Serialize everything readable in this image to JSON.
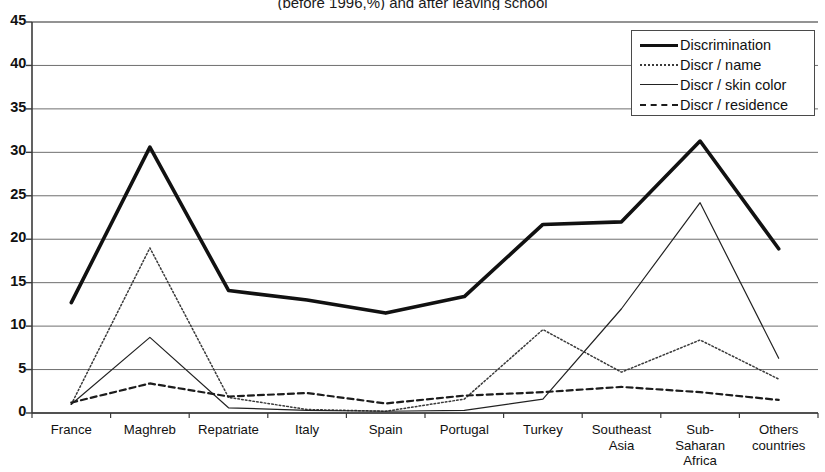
{
  "chart_data": {
    "type": "line",
    "title": "(before 1996,%) and after leaving school",
    "xlabel": "",
    "ylabel": "",
    "ylim": [
      0,
      45
    ],
    "ytick_step": 5,
    "yticks": [
      0,
      5,
      10,
      15,
      20,
      25,
      30,
      35,
      40,
      45
    ],
    "grid": true,
    "legend_position": "top-right",
    "categories": [
      "France",
      "Maghreb",
      "Repatriate",
      "Italy",
      "Spain",
      "Portugal",
      "Turkey",
      "Southeast Asia",
      "Sub-Saharan Africa",
      "Others countries"
    ],
    "category_lines": [
      [
        "France"
      ],
      [
        "Maghreb"
      ],
      [
        "Repatriate"
      ],
      [
        "Italy"
      ],
      [
        "Spain"
      ],
      [
        "Portugal"
      ],
      [
        "Turkey"
      ],
      [
        "Southeast",
        "Asia"
      ],
      [
        "Sub-",
        "Saharan",
        "Africa"
      ],
      [
        "Others",
        "countries"
      ]
    ],
    "series": [
      {
        "name": "Discrimination",
        "style": "thick-solid",
        "color": "#111111",
        "values": [
          12.7,
          30.6,
          14.1,
          13.0,
          11.5,
          13.4,
          21.7,
          22.0,
          31.3,
          18.9
        ]
      },
      {
        "name": "Discr / name",
        "style": "dotted",
        "color": "#3a3a3a",
        "values": [
          1.0,
          19.0,
          1.8,
          0.4,
          0.2,
          1.6,
          9.6,
          4.7,
          8.4,
          3.9
        ]
      },
      {
        "name": "Discr / skin color",
        "style": "thin-solid",
        "color": "#222222",
        "values": [
          1.0,
          8.7,
          0.6,
          0.3,
          0.2,
          0.3,
          1.6,
          12.0,
          24.2,
          6.3
        ]
      },
      {
        "name": "Discr / residence",
        "style": "dashed",
        "color": "#1c1c1c",
        "values": [
          1.2,
          3.4,
          1.9,
          2.3,
          1.1,
          2.0,
          2.4,
          3.0,
          2.4,
          1.5
        ]
      }
    ]
  },
  "legend": {
    "items": [
      {
        "label": "Discrimination"
      },
      {
        "label": "Discr / name"
      },
      {
        "label": "Discr / skin color"
      },
      {
        "label": "Discr / residence"
      }
    ]
  }
}
